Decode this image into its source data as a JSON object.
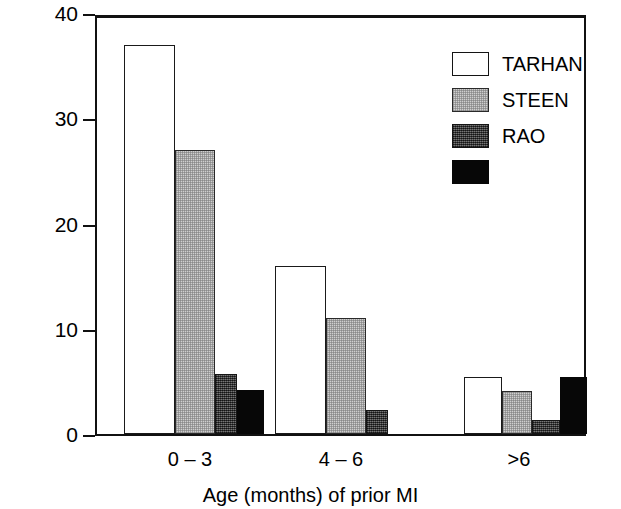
{
  "chart_data": {
    "type": "bar",
    "title": "",
    "xlabel": "Age (months) of prior MI",
    "ylabel": "Reinfarction rate (%)",
    "categories": [
      "0 – 3",
      "4 – 6",
      ">6"
    ],
    "ylim": [
      0,
      40
    ],
    "yticks": [
      0,
      10,
      20,
      30,
      40
    ],
    "ytick_labels": [
      "0",
      "10",
      "20",
      "30",
      "40"
    ],
    "grid": false,
    "legend_position": "top-right",
    "series": [
      {
        "name": "TARHAN",
        "swatch": "white",
        "color": "#ffffff",
        "values": [
          37,
          16,
          5.4
        ]
      },
      {
        "name": "STEEN",
        "swatch": "light-gray",
        "color": "#cfcfcf",
        "values": [
          27,
          11,
          4.1
        ]
      },
      {
        "name": "RAO",
        "swatch": "dark-gray",
        "color": "#4e4e4e",
        "values": [
          5.7,
          2.3,
          1.3
        ]
      },
      {
        "name": "",
        "swatch": "black",
        "color": "#070707",
        "values": [
          4.2,
          0,
          5.4
        ]
      }
    ]
  },
  "axes": {
    "y_title": "Reinfarction rate (%)",
    "x_title": "Age (months) of prior MI",
    "y_ticks": [
      "40",
      "30",
      "20",
      "10",
      "0"
    ],
    "x_labels": [
      "0 – 3",
      "4 – 6",
      ">6"
    ]
  },
  "legend": {
    "entries": [
      {
        "label": "TARHAN",
        "style": "s-tarhan"
      },
      {
        "label": "STEEN",
        "style": "s-steen"
      },
      {
        "label": "RAO",
        "style": "s-rao"
      },
      {
        "label": "",
        "style": "s-black"
      }
    ]
  }
}
